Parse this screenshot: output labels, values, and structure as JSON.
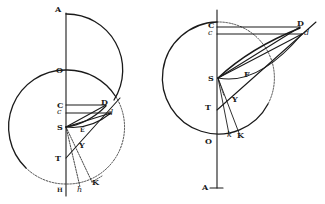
{
  "figure": {
    "background": "#ffffff",
    "ink": "#1a1a1a",
    "left": {
      "labels": {
        "A": "A",
        "O": "O",
        "C": "C",
        "c": "c",
        "D": "D",
        "d": "d",
        "S": "S",
        "E": "E",
        "Y": "Y",
        "T": "T",
        "H": "H",
        "h": "h",
        "K": "K"
      }
    },
    "right": {
      "labels": {
        "C": "C",
        "c": "c",
        "D": "D",
        "d": "d",
        "S": "S",
        "F": "F",
        "Y": "Y",
        "T": "T",
        "O": "O",
        "k": "k",
        "K": "K",
        "A": "A"
      }
    }
  }
}
